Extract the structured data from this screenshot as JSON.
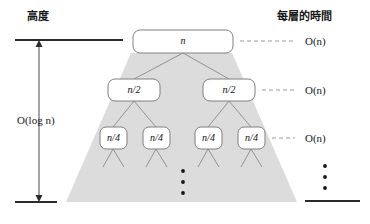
{
  "figure": {
    "left_axis_title": "高度",
    "right_axis_title": "每層的時間",
    "height_measure_label": "O(log n)"
  },
  "tree": {
    "levels": [
      {
        "level_index": 0,
        "nodes": [
          {
            "label": "n"
          }
        ],
        "cost_label": "O(n)"
      },
      {
        "level_index": 1,
        "nodes": [
          {
            "label": "n/2"
          },
          {
            "label": "n/2"
          }
        ],
        "cost_label": "O(n)"
      },
      {
        "level_index": 2,
        "nodes": [
          {
            "label": "n/4"
          },
          {
            "label": "n/4"
          },
          {
            "label": "n/4"
          },
          {
            "label": "n/4"
          }
        ],
        "cost_label": "O(n)"
      }
    ],
    "continuation_marker": "⋮"
  },
  "colors": {
    "cone_fill": "#dcdcdc",
    "node_fill": "#ffffff",
    "node_stroke": "#808080",
    "edge_stroke": "#8a8a8a",
    "axis_stroke": "#2b2b2b",
    "dash_stroke": "#9a9a9a",
    "text": "#111111",
    "background": "#ffffff"
  }
}
